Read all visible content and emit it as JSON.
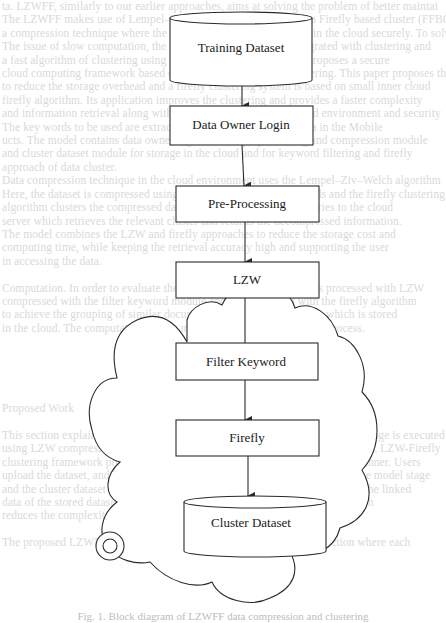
{
  "diagram": {
    "nodes": [
      {
        "id": "training-dataset",
        "label": "Training Dataset",
        "shape": "cylinder"
      },
      {
        "id": "data-owner-login",
        "label": "Data Owner Login",
        "shape": "rectangle"
      },
      {
        "id": "pre-processing",
        "label": "Pre-Processing",
        "shape": "rectangle"
      },
      {
        "id": "lzw",
        "label": "LZW",
        "shape": "rectangle"
      },
      {
        "id": "filter-keyword",
        "label": "Filter Keyword",
        "shape": "rectangle",
        "group": "cloud"
      },
      {
        "id": "firefly",
        "label": "Firefly",
        "shape": "rectangle",
        "group": "cloud"
      },
      {
        "id": "cluster-dataset",
        "label": "Cluster Dataset",
        "shape": "cylinder",
        "group": "cloud"
      }
    ],
    "edges": [
      {
        "from": "training-dataset",
        "to": "data-owner-login"
      },
      {
        "from": "data-owner-login",
        "to": "pre-processing"
      },
      {
        "from": "pre-processing",
        "to": "lzw"
      },
      {
        "from": "lzw",
        "to": "filter-keyword"
      },
      {
        "from": "filter-keyword",
        "to": "firefly"
      },
      {
        "from": "firefly",
        "to": "cluster-dataset"
      }
    ],
    "group": {
      "id": "cloud",
      "shape": "cloud",
      "label": ""
    },
    "colors": {
      "stroke": "#2a2a2a",
      "text": "#1a1a1a",
      "background": "#ffffff",
      "bleed_text": "#d9d9d9"
    }
  },
  "caption": "Fig. 1. Block diagram of LZWFF data compression and clustering",
  "bleed_through_text": [
    "ta. LZWFF, similarly to our earlier approaches, aims at solving the problem of better maintai",
    "The LZWFF makes use of Lempel–Ziv–Welch compression with a Firefly based cluster (FFBC",
    "a compression technique where the data is compressed and stored in the cloud securely. To solve",
    "The issue of slow computation, the compression algorithm is integrated with clustering and",
    "a fast algorithm of clustering using the firefly method, this work proposes a secure",
    "cloud computing framework based on data compression and clustering. This paper proposes the",
    "to reduce the storage overhead and a firefly clustering system is based on small inner cloud",
    "firefly algorithm. Its application improves the clustering and provides a faster complexity",
    "and information retrieval along with secure storage of data in cloud environment and security",
    "The key words to be used are extracted, and preprocessing the data in the Mobile",
    "ucts. The model contains data owner login, dataset preprocessing and compression module",
    "and cluster dataset module for storage in the cloud and for keyword filtering and firefly",
    "approach of data cluster.",
    "Data compression technique in the cloud environment uses the Lempel–Ziv–Welch algorithm",
    "Here, the dataset is compressed using LZW and filtered by keywords and the firefly clustering",
    "algorithm clusters the compressed data into groups. Users send queries to the cloud",
    "server which retrieves the relevant cluster and returns the decompressed information.",
    "The model combines the LZW and firefly approaches to reduce the storage cost and",
    "computing time, while keeping the retrieval accuracy high and supporting the user",
    "in accessing the data.",
    "",
    "Computation. In order to evaluate the proposed model, the dataset is processed with LZW",
    "compressed with the filter keyword module and then clustered with the firefly algorithm",
    "to achieve the grouping of similar documents into the cluster dataset which is stored",
    "in the cloud. The computation time is measured for each stage of the process.",
    "",
    "",
    "",
    "",
    "",
    "Proposed Work",
    "",
    "This section explains the methodology of the proposed work in which data storage is executed",
    "using LZW compression and the Firefly algorithm in the cloud, named LZWFF. LZW-Firefly",
    "clustering framework proposed for the cloud to store data in a compressed manner. Users",
    "upload the dataset, and the keyword filtering and the clustering are done in the model stage",
    "and the cluster dataset is stored in the cloud server. The final output contains the linked",
    "data of the stored dataset in the cloud with the LZW compressed format, which",
    "reduces the complexity of information retrieval.",
    "",
    "The proposed LZWFF model is explained in detail in the following section where each"
  ]
}
